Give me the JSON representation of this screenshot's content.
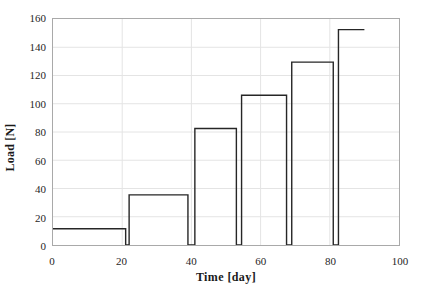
{
  "chart_data": {
    "type": "line",
    "subtype": "step",
    "title": "",
    "xlabel": "Time [day]",
    "ylabel": "Load [N]",
    "xlim": [
      0,
      100
    ],
    "ylim": [
      0,
      160
    ],
    "xticks": [
      0,
      20,
      40,
      60,
      80,
      100
    ],
    "yticks": [
      0,
      20,
      40,
      60,
      80,
      100,
      120,
      140,
      160
    ],
    "grid": true,
    "legend": false,
    "line_color": "#262626",
    "grid_color": "#e4e4e4",
    "frame_color": "#a9a9a9",
    "series": [
      {
        "name": "Load",
        "x": [
          0,
          21,
          21,
          22,
          22,
          39,
          39,
          41,
          41,
          53,
          53,
          54.5,
          54.5,
          67.5,
          67.5,
          69,
          69,
          81,
          81,
          82.5,
          82.5,
          90
        ],
        "y": [
          11.5,
          11.5,
          0,
          0,
          35.5,
          35.5,
          0,
          0,
          82.5,
          82.5,
          0,
          0,
          106,
          106,
          0,
          0,
          129.5,
          129.5,
          0,
          0,
          152.5,
          152.5
        ]
      }
    ],
    "steps": [
      {
        "label": "step-1",
        "load": 11.5,
        "start_day": 0,
        "end_day": 21
      },
      {
        "label": "step-2",
        "load": 35.5,
        "start_day": 22,
        "end_day": 39
      },
      {
        "label": "step-3",
        "load": 82.5,
        "start_day": 41,
        "end_day": 53
      },
      {
        "label": "step-4",
        "load": 106,
        "start_day": 54.5,
        "end_day": 67.5
      },
      {
        "label": "step-5",
        "load": 129.5,
        "start_day": 69,
        "end_day": 81
      },
      {
        "label": "step-6",
        "load": 152.5,
        "start_day": 82.5,
        "end_day": 90
      }
    ],
    "ytick_labels": [
      "0",
      "20",
      "40",
      "60",
      "80",
      "100",
      "120",
      "140",
      "160"
    ],
    "xtick_labels": [
      "0",
      "20",
      "40",
      "60",
      "80",
      "100"
    ]
  }
}
